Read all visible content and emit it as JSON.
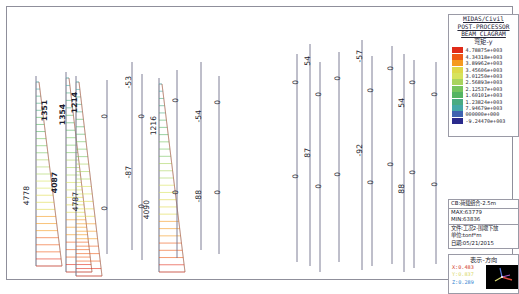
{
  "window": {
    "title": "MIDAS/Civil Beam Diagram Post-Processor"
  },
  "legend_panel": {
    "title_lines": [
      "MIDAS/Civil",
      "POST-PROCESSOR",
      "BEAM CLAGRAM"
    ],
    "subtitle": "弯矩-y",
    "entries": [
      {
        "value": "4.78875e+003",
        "color": "#e02b1a"
      },
      {
        "value": "4.34318e+003",
        "color": "#ef5a16"
      },
      {
        "value": "3.89962e+003",
        "color": "#f59a20"
      },
      {
        "value": "3.45606e+003",
        "color": "#ded94a"
      },
      {
        "value": "3.01250e+003",
        "color": "#d7e35c"
      },
      {
        "value": "2.56893e+003",
        "color": "#a9d45e"
      },
      {
        "value": "2.12537e+003",
        "color": "#76c45f"
      },
      {
        "value": "1.60101e+003",
        "color": "#55b463"
      },
      {
        "value": "1.23824e+003",
        "color": "#49ab82"
      },
      {
        "value": "7.94679e+003",
        "color": "#45a8a8"
      },
      {
        "value": "000000e+000",
        "color": "#3f63b0"
      },
      {
        "value": "-9.24470e+003",
        "color": "#2a2a8c"
      }
    ]
  },
  "info_panel": {
    "case_label": "CB:荷载组合-2.5m",
    "max_label": "MAX:63779",
    "min_label": "MIN:63836",
    "file_label": "文件:工况2-围堰下放",
    "unit_label": "单位:tonf*m",
    "date_label": "日期:05/21/2015"
  },
  "direction_panel": {
    "title": "表示-方向",
    "x": "X:0.483",
    "y": "Y:0.837",
    "z": "Z:0.289"
  },
  "chart_data": {
    "type": "diagram",
    "title": "BEAM CLAGRAM 弯矩-y",
    "units": "tonf*m",
    "members": [
      {
        "id": "m1",
        "x": 22,
        "top": 62,
        "bottom": 252,
        "fill_top": 1351,
        "fill_bottom": 4778,
        "shaded": true,
        "labels": [
          {
            "text": "1351",
            "x": 26,
            "y": 86,
            "bold": true
          },
          {
            "text": "4778",
            "x": 8,
            "y": 172,
            "bold": false
          }
        ]
      },
      {
        "id": "m2",
        "x": 52,
        "top": 58,
        "bottom": 258,
        "fill_top": 1214,
        "fill_bottom": 4087,
        "shaded": true,
        "labels": [
          {
            "text": "1214",
            "x": 56,
            "y": 78,
            "bold": true
          },
          {
            "text": "4087",
            "x": 36,
            "y": 158,
            "bold": true
          }
        ]
      },
      {
        "id": "m3",
        "x": 62,
        "top": 62,
        "bottom": 262,
        "fill_top": 1354,
        "fill_bottom": 4787,
        "shaded": true,
        "labels": [
          {
            "text": "1354",
            "x": 44,
            "y": 90,
            "bold": true
          },
          {
            "text": "4787",
            "x": 57,
            "y": 178,
            "bold": false
          }
        ]
      },
      {
        "id": "m4",
        "x": 93,
        "top": 66,
        "bottom": 240,
        "labels": [
          {
            "text": "0",
            "x": 86,
            "y": 100,
            "bold": false
          },
          {
            "text": "0",
            "x": 86,
            "y": 192,
            "bold": false
          }
        ]
      },
      {
        "id": "m5",
        "x": 118,
        "top": 48,
        "bottom": 236,
        "labels": [
          {
            "text": "-53",
            "x": 110,
            "y": 62,
            "bold": false
          },
          {
            "text": "-87",
            "x": 110,
            "y": 152,
            "bold": false
          }
        ]
      },
      {
        "id": "m6",
        "x": 128,
        "top": 60,
        "bottom": 246,
        "labels": [
          {
            "text": "0",
            "x": 123,
            "y": 100,
            "bold": false
          },
          {
            "text": "0",
            "x": 123,
            "y": 190,
            "bold": false
          }
        ]
      },
      {
        "id": "m7",
        "x": 145,
        "top": 64,
        "bottom": 258,
        "fill_top": 1216,
        "fill_bottom": 4090,
        "shaded": true,
        "labels": [
          {
            "text": "1216",
            "x": 135,
            "y": 102,
            "bold": false
          },
          {
            "text": "4090",
            "x": 128,
            "y": 186,
            "bold": false
          }
        ]
      },
      {
        "id": "m8",
        "x": 163,
        "top": 56,
        "bottom": 244,
        "labels": [
          {
            "text": "0",
            "x": 157,
            "y": 84,
            "bold": false
          },
          {
            "text": "0",
            "x": 157,
            "y": 176,
            "bold": false
          }
        ]
      },
      {
        "id": "m9",
        "x": 187,
        "top": 48,
        "bottom": 236,
        "labels": [
          {
            "text": "-54",
            "x": 180,
            "y": 96,
            "bold": false
          },
          {
            "text": "-88",
            "x": 180,
            "y": 176,
            "bold": false
          }
        ]
      },
      {
        "id": "m10",
        "x": 205,
        "top": 62,
        "bottom": 240,
        "labels": [
          {
            "text": "0",
            "x": 199,
            "y": 86,
            "bold": false
          },
          {
            "text": "0",
            "x": 199,
            "y": 176,
            "bold": false
          }
        ]
      },
      {
        "id": "m11",
        "x": 283,
        "top": 40,
        "bottom": 248,
        "labels": [
          {
            "text": "0",
            "x": 277,
            "y": 66,
            "bold": false
          },
          {
            "text": "0",
            "x": 277,
            "y": 160,
            "bold": false
          }
        ]
      },
      {
        "id": "m12",
        "x": 296,
        "top": 30,
        "bottom": 252,
        "labels": [
          {
            "text": "54",
            "x": 289,
            "y": 42,
            "bold": false
          },
          {
            "text": "87",
            "x": 289,
            "y": 134,
            "bold": false
          }
        ]
      },
      {
        "id": "m13",
        "x": 306,
        "top": 48,
        "bottom": 258,
        "labels": [
          {
            "text": "0",
            "x": 300,
            "y": 78,
            "bold": false
          },
          {
            "text": "0",
            "x": 300,
            "y": 170,
            "bold": false
          }
        ]
      },
      {
        "id": "m14",
        "x": 325,
        "top": 38,
        "bottom": 248,
        "labels": [
          {
            "text": "0",
            "x": 319,
            "y": 62,
            "bold": false
          },
          {
            "text": "0",
            "x": 319,
            "y": 158,
            "bold": false
          }
        ]
      },
      {
        "id": "m15",
        "x": 348,
        "top": 26,
        "bottom": 256,
        "labels": [
          {
            "text": "-57",
            "x": 341,
            "y": 36,
            "bold": false
          },
          {
            "text": "-92",
            "x": 341,
            "y": 130,
            "bold": false
          }
        ]
      },
      {
        "id": "m16",
        "x": 358,
        "top": 42,
        "bottom": 252,
        "labels": [
          {
            "text": "0",
            "x": 352,
            "y": 74,
            "bold": false
          },
          {
            "text": "0",
            "x": 352,
            "y": 166,
            "bold": false
          }
        ]
      },
      {
        "id": "m17",
        "x": 378,
        "top": 32,
        "bottom": 250,
        "labels": [
          {
            "text": "0",
            "x": 372,
            "y": 52,
            "bold": false
          },
          {
            "text": "0",
            "x": 372,
            "y": 148,
            "bold": false
          }
        ]
      },
      {
        "id": "m18",
        "x": 390,
        "top": 40,
        "bottom": 258,
        "labels": [
          {
            "text": "54",
            "x": 383,
            "y": 84,
            "bold": false
          },
          {
            "text": "88",
            "x": 383,
            "y": 170,
            "bold": false
          }
        ]
      },
      {
        "id": "m19",
        "x": 400,
        "top": 46,
        "bottom": 254,
        "labels": [
          {
            "text": "0",
            "x": 394,
            "y": 66,
            "bold": false
          },
          {
            "text": "0",
            "x": 394,
            "y": 156,
            "bold": false
          }
        ]
      },
      {
        "id": "m20",
        "x": 422,
        "top": 48,
        "bottom": 250,
        "labels": [
          {
            "text": "0",
            "x": 416,
            "y": 78,
            "bold": false
          },
          {
            "text": "0",
            "x": 416,
            "y": 168,
            "bold": false
          }
        ]
      }
    ]
  }
}
